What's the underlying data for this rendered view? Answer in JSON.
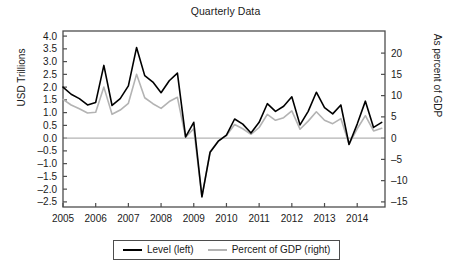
{
  "chart_data": {
    "type": "line",
    "title": "Quarterly Data",
    "xlabel": "",
    "ylabel": "USD Trillions",
    "ylabel_right": "As percent of GDP",
    "grid": false,
    "legend_position": "bottom",
    "x_tick_labels": [
      "2005",
      "2006",
      "2007",
      "2008",
      "2009",
      "2010",
      "2011",
      "2012",
      "2013",
      "2014"
    ],
    "x_tick_values": [
      2005,
      2006,
      2007,
      2008,
      2009,
      2010,
      2011,
      2012,
      2013,
      2014
    ],
    "xlim": [
      2005.0,
      2014.85
    ],
    "ylim": [
      -2.7,
      4.2
    ],
    "y_tick_labels": [
      "4.0",
      "3.5",
      "3.0",
      "2.5",
      "2.0",
      "1.5",
      "1.0",
      "0.5",
      "0.0",
      "–0.5",
      "–1.0",
      "–1.5",
      "–2.0",
      "–2.5"
    ],
    "y_tick_values": [
      4.0,
      3.5,
      3.0,
      2.5,
      2.0,
      1.5,
      1.0,
      0.5,
      0.0,
      -0.5,
      -1.0,
      -1.5,
      -2.0,
      -2.5
    ],
    "ylim_right": [
      -16.2,
      25.2
    ],
    "y_tick_labels_right": [
      "20",
      "15",
      "10",
      "5",
      "0",
      "–5",
      "–10",
      "–15"
    ],
    "y_tick_values_right": [
      20,
      15,
      10,
      5,
      0,
      -5,
      -10,
      -15
    ],
    "zero_line": 0,
    "x": [
      2005.0,
      2005.25,
      2005.5,
      2005.75,
      2006.0,
      2006.25,
      2006.5,
      2006.75,
      2007.0,
      2007.25,
      2007.5,
      2007.75,
      2008.0,
      2008.25,
      2008.5,
      2008.75,
      2009.0,
      2009.25,
      2009.5,
      2009.75,
      2010.0,
      2010.25,
      2010.5,
      2010.75,
      2011.0,
      2011.25,
      2011.5,
      2011.75,
      2012.0,
      2012.25,
      2012.5,
      2012.75,
      2013.0,
      2013.25,
      2013.5,
      2013.75,
      2014.0,
      2014.25,
      2014.5,
      2014.75
    ],
    "series": [
      {
        "name": "Level (left)",
        "axis": "left",
        "units": "USD Trillions",
        "color": "#000000",
        "values": [
          2.0,
          1.72,
          1.55,
          1.3,
          1.4,
          2.85,
          1.28,
          1.55,
          2.05,
          3.55,
          2.45,
          2.2,
          1.78,
          2.25,
          2.55,
          0.05,
          0.62,
          -2.3,
          -0.55,
          -0.12,
          0.12,
          0.75,
          0.55,
          0.2,
          0.62,
          1.35,
          1.05,
          1.25,
          1.62,
          0.52,
          1.05,
          1.8,
          1.2,
          0.95,
          1.3,
          -0.25,
          0.55,
          1.45,
          0.42,
          0.62
        ]
      },
      {
        "name": "Percent of GDP (right)",
        "axis": "right",
        "units": "Percent of GDP",
        "color": "#b3b3b3",
        "values": [
          9.1,
          7.8,
          6.9,
          5.9,
          6.1,
          12.0,
          5.6,
          6.6,
          8.2,
          15.0,
          9.5,
          8.1,
          7.0,
          8.6,
          9.6,
          0.2,
          2.2,
          -13.8,
          -3.2,
          -0.7,
          0.6,
          3.2,
          2.2,
          0.9,
          2.5,
          5.6,
          4.2,
          4.8,
          6.4,
          2.1,
          4.0,
          6.2,
          4.2,
          3.4,
          4.6,
          -1.4,
          2.2,
          5.3,
          1.7,
          2.3
        ]
      }
    ],
    "legend": [
      {
        "label": "Level (left)",
        "color": "#000000"
      },
      {
        "label": "Percent of GDP (right)",
        "color": "#b3b3b3"
      }
    ],
    "_rest_of_left_series_tail": [
      0.62,
      0.75,
      0.85,
      1.0,
      1.05,
      0.9,
      0.55,
      0.48,
      0.72,
      1.15,
      1.35,
      1.38,
      1.25,
      0.55
    ],
    "_rest_of_right_series_tail": [
      2.3,
      2.8,
      3.3,
      3.9,
      4.1,
      3.5,
      2.1,
      1.9,
      2.8,
      4.4,
      5.2,
      5.3,
      4.8,
      2.1
    ]
  },
  "axes": {
    "frame_color": "#4d4d4d",
    "zero_line_color": "#b3b3b3"
  }
}
